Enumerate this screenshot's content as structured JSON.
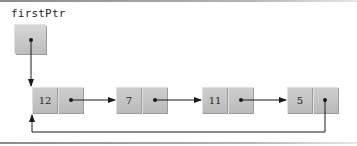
{
  "diagram": {
    "pointer": {
      "label": "firstPtr"
    },
    "nodes": [
      {
        "value": "12"
      },
      {
        "value": "7"
      },
      {
        "value": "11"
      },
      {
        "value": "5"
      }
    ],
    "links": [
      {
        "from": "firstPtr",
        "to": "12"
      },
      {
        "from": "12",
        "to": "7"
      },
      {
        "from": "7",
        "to": "11"
      },
      {
        "from": "11",
        "to": "5"
      },
      {
        "from": "5",
        "to": "12",
        "type": "circular-back-link"
      }
    ],
    "colors": {
      "node_fill": "#c4c4c4",
      "line": "#1a1a1a",
      "rule": "#9a9a9a"
    }
  }
}
